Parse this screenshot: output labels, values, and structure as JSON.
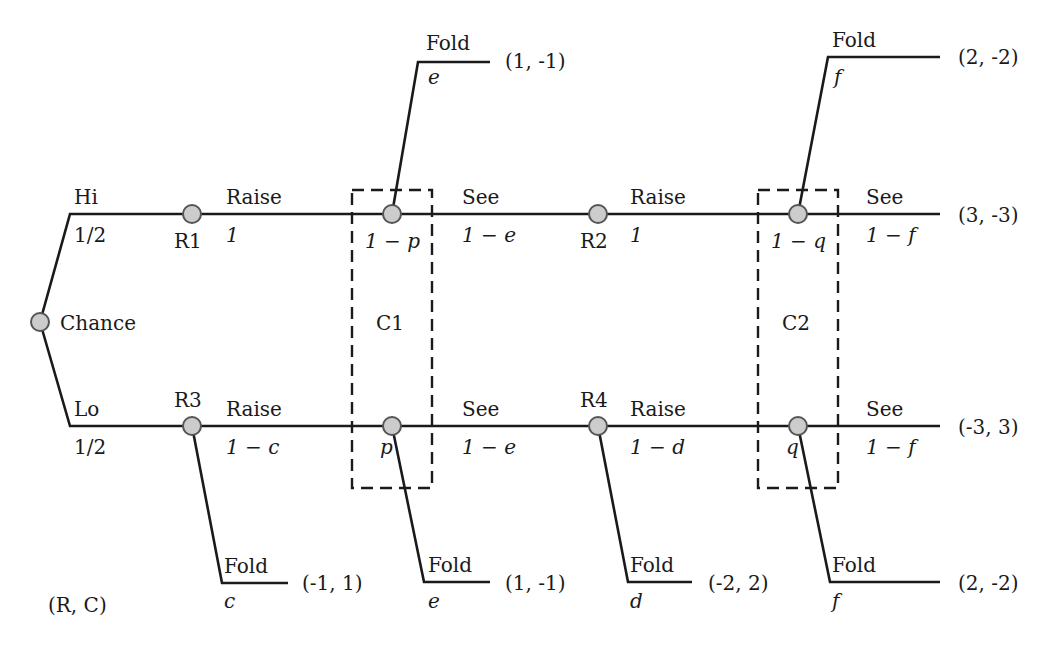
{
  "diagram": {
    "type": "extensive-form game tree",
    "legend": "(R, C)",
    "chance": {
      "label": "Chance"
    },
    "branches": {
      "hi": {
        "label": "Hi",
        "prob": "1/2"
      },
      "lo": {
        "label": "Lo",
        "prob": "1/2"
      }
    },
    "nodes": {
      "r1": "R1",
      "r2": "R2",
      "r3": "R3",
      "r4": "R4"
    },
    "info_sets": {
      "c1": "C1",
      "c2": "C2"
    },
    "top_row": {
      "r1_action": "Raise",
      "r1_prob": "1",
      "c1_prob": "1 − p",
      "c1_see": "See",
      "c1_see_prob": "1 − e",
      "c1_fold": "Fold",
      "c1_fold_prob": "e",
      "c1_fold_payoff": "(1, -1)",
      "r2_action": "Raise",
      "r2_prob": "1",
      "c2_prob": "1 − q",
      "c2_see": "See",
      "c2_see_prob": "1 − f",
      "c2_see_payoff": "(3, -3)",
      "c2_fold": "Fold",
      "c2_fold_prob": "f",
      "c2_fold_payoff": "(2, -2)"
    },
    "bottom_row": {
      "r3_action": "Raise",
      "r3_prob": "1 − c",
      "r3_fold": "Fold",
      "r3_fold_prob": "c",
      "r3_fold_payoff": "(-1, 1)",
      "c1_prob": "p",
      "c1_see": "See",
      "c1_see_prob": "1 − e",
      "c1_fold": "Fold",
      "c1_fold_prob": "e",
      "c1_fold_payoff": "(1, -1)",
      "r4_action": "Raise",
      "r4_prob": "1 − d",
      "r4_fold": "Fold",
      "r4_fold_prob": "d",
      "r4_fold_payoff": "(-2, 2)",
      "c2_prob": "q",
      "c2_see": "See",
      "c2_see_prob": "1 − f",
      "c2_see_payoff": "(-3, 3)",
      "c2_fold": "Fold",
      "c2_fold_prob": "f",
      "c2_fold_payoff": "(2, -2)"
    }
  }
}
